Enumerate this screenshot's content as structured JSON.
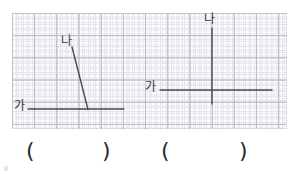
{
  "page": {
    "background_color": "#ffffff",
    "width": 297,
    "height": 174
  },
  "grid": {
    "line_color": "#b9bcc4",
    "minor_line_color": "#e2e4ea",
    "cell_size_px": 22,
    "x": 12,
    "y": 13,
    "width": 275,
    "height": 116
  },
  "figures": {
    "stroke_color": "#4a4a4a",
    "left": {
      "name": "acute-angle-figure",
      "ray_ga": {
        "label": "가",
        "x1": 28,
        "y1": 109,
        "x2": 124,
        "y2": 109
      },
      "ray_na": {
        "label": "나",
        "x1": 88,
        "y1": 109,
        "x2": 72,
        "y2": 47
      },
      "vertex": {
        "x": 88,
        "y": 109
      }
    },
    "right": {
      "name": "right-angle-figure",
      "ray_ga": {
        "label": "가",
        "x1": 160,
        "y1": 90,
        "x2": 272,
        "y2": 90
      },
      "ray_na": {
        "label": "나",
        "x1": 212,
        "y1": 28,
        "x2": 212,
        "y2": 104
      },
      "vertex": {
        "x": 212,
        "y": 90
      }
    }
  },
  "labels": {
    "left_na": "나",
    "left_ga": "가",
    "right_na": "나",
    "right_ga": "가"
  },
  "answers": {
    "blank_1": {
      "open": "(",
      "close": ")",
      "value": ""
    },
    "blank_2": {
      "open": "(",
      "close": ")",
      "value": ""
    }
  }
}
